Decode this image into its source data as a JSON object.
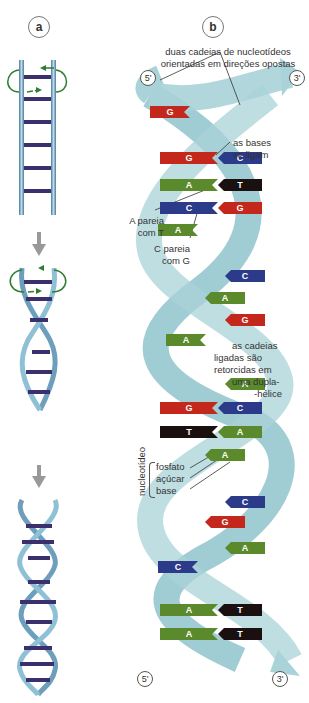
{
  "panels": {
    "a": {
      "label": "a"
    },
    "b": {
      "label": "b"
    }
  },
  "ends": {
    "top_left": "5'",
    "top_right": "3'",
    "bottom_left": "5'",
    "bottom_right": "3'"
  },
  "annotations": {
    "strands": [
      "duas cadeias de nucleotídeos",
      "orientadas em direções opostas"
    ],
    "bases_bind": [
      "as bases",
      "se ligam"
    ],
    "a_pairs_t": [
      "A pareia",
      "com T"
    ],
    "c_pairs_g": [
      "C pareia",
      "com G"
    ],
    "double_helix": [
      "as cadeias",
      "ligadas são",
      "retorcidas em",
      "uma dupla-",
      "-hélice"
    ],
    "nucleotide": "nucleotídeo",
    "nucleotide_parts": [
      "fosfato",
      "açúcar",
      "base"
    ]
  },
  "base_pairs": [
    {
      "y": 112,
      "left": "G",
      "right": ""
    },
    {
      "y": 158,
      "left": "G",
      "right": "C"
    },
    {
      "y": 185,
      "left": "A",
      "right": "T"
    },
    {
      "y": 208,
      "left": "C",
      "right": "G"
    },
    {
      "y": 230,
      "left": "A",
      "right": ""
    },
    {
      "y": 276,
      "left": "",
      "right": "C"
    },
    {
      "y": 298,
      "left": "",
      "right": "A"
    },
    {
      "y": 320,
      "left": "",
      "right": "G"
    },
    {
      "y": 340,
      "left": "A",
      "right": ""
    },
    {
      "y": 384,
      "left": "",
      "right": "A"
    },
    {
      "y": 408,
      "left": "G",
      "right": "C"
    },
    {
      "y": 432,
      "left": "T",
      "right": "A"
    },
    {
      "y": 455,
      "left": "",
      "right": "A"
    },
    {
      "y": 502,
      "left": "",
      "right": "C"
    },
    {
      "y": 522,
      "left": "",
      "right": "G"
    },
    {
      "y": 548,
      "left": "",
      "right": "A"
    },
    {
      "y": 567,
      "left": "C",
      "right": ""
    },
    {
      "y": 610,
      "left": "A",
      "right": "T"
    },
    {
      "y": 634,
      "left": "A",
      "right": "T"
    }
  ],
  "colors": {
    "A": "#5a8a2c",
    "T": "#1a1010",
    "G": "#c4281c",
    "C": "#2c3a8a",
    "ribbon": "#a9d3d8",
    "ribbon_dark": "#7fb6bf",
    "sugar": "#9b6a86",
    "phosphate": "#1f3d2a",
    "rung": "#3b2f6e",
    "arrow": "#999999",
    "rotate_arrow": "#2e7d32"
  }
}
